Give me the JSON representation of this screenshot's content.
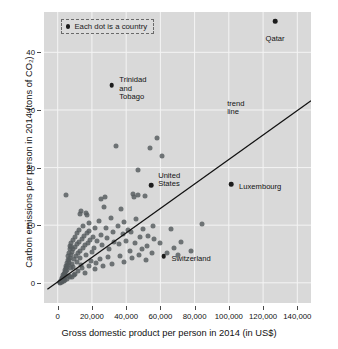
{
  "chart_data": {
    "type": "scatter",
    "title": "",
    "xlabel": "Gross domestic product per person in 2014 (in US$)",
    "ylabel": "Carbon emissions per person in 2014 (tons of CO₂)",
    "xlim": [
      -8000,
      148000
    ],
    "ylim": [
      -3.5,
      47
    ],
    "grid": true,
    "xticks": [
      0,
      20000,
      40000,
      60000,
      80000,
      100000,
      120000,
      140000
    ],
    "xticklabels": [
      "0",
      "20,000",
      "40,000",
      "60,000",
      "80,000",
      "100,000",
      "120,000",
      "140,000"
    ],
    "yticks": [
      0,
      10,
      20,
      30,
      40
    ],
    "yticklabels": [
      "0",
      "10",
      "20",
      "30",
      "40"
    ],
    "legend": {
      "position": "top-left-inside",
      "entries": [
        {
          "marker": "dot",
          "label": "Each dot is a country"
        }
      ]
    },
    "annotations": [
      {
        "label": "Qatar",
        "x": 127000,
        "y": 45.4,
        "text_dx": 0,
        "text_dy": -2.4,
        "align": "center"
      },
      {
        "label": "Trinidad\nand\nTobago",
        "x": 31500,
        "y": 34.3,
        "text_dx": 4500,
        "text_dy": 1.6,
        "align": "left"
      },
      {
        "label": "United\nStates",
        "x": 54500,
        "y": 16.9,
        "text_dx": 4200,
        "text_dy": 2.4,
        "align": "left"
      },
      {
        "label": "Luxembourg",
        "x": 101500,
        "y": 17.1,
        "text_dx": 4500,
        "text_dy": 0.2,
        "align": "left"
      },
      {
        "label": "Switzerland",
        "x": 62000,
        "y": 4.6,
        "text_dx": 4500,
        "text_dy": 0.2,
        "align": "left"
      },
      {
        "label": "trend\nline",
        "x": 99000,
        "y": 31.8,
        "text_dx": 0,
        "text_dy": 0,
        "align": "left",
        "is_point": false
      }
    ],
    "trend_line": {
      "label": "trend line",
      "x_start": -6000,
      "y_start": -1.1,
      "x_end": 148000,
      "y_end": 31.6,
      "color": "#111111"
    },
    "highlighted_points": [
      {
        "name": "Qatar",
        "x": 127000,
        "y": 45.4
      },
      {
        "name": "Trinidad and Tobago",
        "x": 31500,
        "y": 34.3
      },
      {
        "name": "United States",
        "x": 54500,
        "y": 16.9
      },
      {
        "name": "Luxembourg",
        "x": 101500,
        "y": 17.1
      },
      {
        "name": "Switzerland",
        "x": 62000,
        "y": 4.6
      }
    ],
    "points": [
      [
        1200,
        0.1
      ],
      [
        1400,
        0.2
      ],
      [
        1600,
        0.05
      ],
      [
        1800,
        0.3
      ],
      [
        2000,
        0.4
      ],
      [
        2100,
        0.15
      ],
      [
        2300,
        0.6
      ],
      [
        2500,
        0.35
      ],
      [
        2600,
        0.8
      ],
      [
        2800,
        0.5
      ],
      [
        3000,
        1.0
      ],
      [
        3100,
        0.7
      ],
      [
        3300,
        1.3
      ],
      [
        3500,
        0.9
      ],
      [
        3600,
        1.6
      ],
      [
        3800,
        1.1
      ],
      [
        4000,
        1.9
      ],
      [
        4100,
        1.4
      ],
      [
        4300,
        2.2
      ],
      [
        4500,
        1.7
      ],
      [
        4700,
        2.5
      ],
      [
        4900,
        2.0
      ],
      [
        5000,
        3.0
      ],
      [
        5200,
        2.3
      ],
      [
        5400,
        3.4
      ],
      [
        5600,
        2.7
      ],
      [
        5800,
        4.0
      ],
      [
        6000,
        3.1
      ],
      [
        6200,
        4.6
      ],
      [
        6400,
        3.5
      ],
      [
        6600,
        5.2
      ],
      [
        6800,
        3.9
      ],
      [
        7000,
        5.8
      ],
      [
        7200,
        4.3
      ],
      [
        7400,
        6.4
      ],
      [
        7600,
        4.8
      ],
      [
        7800,
        2.6
      ],
      [
        8000,
        6.9
      ],
      [
        8300,
        5.3
      ],
      [
        8600,
        3.3
      ],
      [
        8900,
        7.4
      ],
      [
        9200,
        5.8
      ],
      [
        9500,
        4.1
      ],
      [
        9800,
        8.0
      ],
      [
        10200,
        6.2
      ],
      [
        10600,
        4.7
      ],
      [
        11000,
        8.6
      ],
      [
        11400,
        6.7
      ],
      [
        11800,
        5.1
      ],
      [
        12200,
        9.2
      ],
      [
        12600,
        7.1
      ],
      [
        13000,
        5.6
      ],
      [
        13500,
        12.4
      ],
      [
        14000,
        7.6
      ],
      [
        14500,
        6.0
      ],
      [
        15000,
        9.8
      ],
      [
        15500,
        8.1
      ],
      [
        16000,
        6.5
      ],
      [
        16500,
        12.2
      ],
      [
        17000,
        8.6
      ],
      [
        17500,
        7.0
      ],
      [
        18000,
        10.4
      ],
      [
        18500,
        9.0
      ],
      [
        19000,
        7.4
      ],
      [
        20000,
        5.4
      ],
      [
        20500,
        8.0
      ],
      [
        21000,
        6.1
      ],
      [
        22000,
        9.5
      ],
      [
        23000,
        7.2
      ],
      [
        24000,
        10.8
      ],
      [
        25000,
        8.3
      ],
      [
        26000,
        6.6
      ],
      [
        27000,
        13.1
      ],
      [
        28000,
        9.6
      ],
      [
        29000,
        7.8
      ],
      [
        30000,
        5.9
      ],
      [
        31000,
        11.2
      ],
      [
        32000,
        8.9
      ],
      [
        33000,
        7.1
      ],
      [
        34000,
        23.8
      ],
      [
        35000,
        9.9
      ],
      [
        36000,
        6.8
      ],
      [
        37000,
        12.8
      ],
      [
        38000,
        8.4
      ],
      [
        39000,
        10.6
      ],
      [
        40000,
        7.3
      ],
      [
        41000,
        9.1
      ],
      [
        42000,
        5.5
      ],
      [
        43000,
        8.8
      ],
      [
        44000,
        15.4
      ],
      [
        45000,
        6.9
      ],
      [
        46000,
        11.0
      ],
      [
        47000,
        19.6
      ],
      [
        48000,
        7.9
      ],
      [
        49000,
        5.8
      ],
      [
        50000,
        9.3
      ],
      [
        51000,
        15.1
      ],
      [
        52000,
        6.4
      ],
      [
        53000,
        8.2
      ],
      [
        54000,
        23.4
      ],
      [
        55000,
        5.2
      ],
      [
        56000,
        7.6
      ],
      [
        58000,
        25.2
      ],
      [
        60000,
        6.9
      ],
      [
        61000,
        22.0
      ],
      [
        64000,
        5.1
      ],
      [
        66000,
        9.4
      ],
      [
        68000,
        6.0
      ],
      [
        70000,
        4.9
      ],
      [
        72000,
        7.1
      ],
      [
        78000,
        5.6
      ],
      [
        84000,
        10.2
      ],
      [
        5000,
        15.3
      ],
      [
        7700,
        6.3
      ],
      [
        9000,
        2.8
      ],
      [
        11500,
        3.6
      ],
      [
        13200,
        4.4
      ],
      [
        16800,
        4.9
      ],
      [
        19500,
        3.8
      ],
      [
        24500,
        4.2
      ],
      [
        29500,
        4.5
      ],
      [
        36500,
        4.6
      ],
      [
        43500,
        4.3
      ],
      [
        47500,
        4.8
      ],
      [
        51500,
        4.0
      ],
      [
        12800,
        12.0
      ],
      [
        17200,
        11.7
      ],
      [
        25500,
        14.5
      ],
      [
        27500,
        14.9
      ],
      [
        44500,
        14.9
      ],
      [
        47000,
        15.2
      ],
      [
        6500,
        1.2
      ],
      [
        8200,
        1.0
      ],
      [
        10000,
        1.5
      ],
      [
        12000,
        2.1
      ],
      [
        14200,
        2.5
      ],
      [
        15800,
        1.8
      ],
      [
        18200,
        2.9
      ],
      [
        21500,
        2.4
      ],
      [
        3400,
        0.25
      ],
      [
        4200,
        0.45
      ],
      [
        5500,
        0.65
      ],
      [
        2400,
        0.1
      ],
      [
        1900,
        0.08
      ],
      [
        6900,
        1.05
      ],
      [
        9600,
        1.35
      ],
      [
        13800,
        3.1
      ],
      [
        22500,
        3.4
      ],
      [
        26500,
        2.9
      ],
      [
        31500,
        3.2
      ],
      [
        38500,
        3.7
      ],
      [
        55500,
        9.8
      ]
    ]
  }
}
